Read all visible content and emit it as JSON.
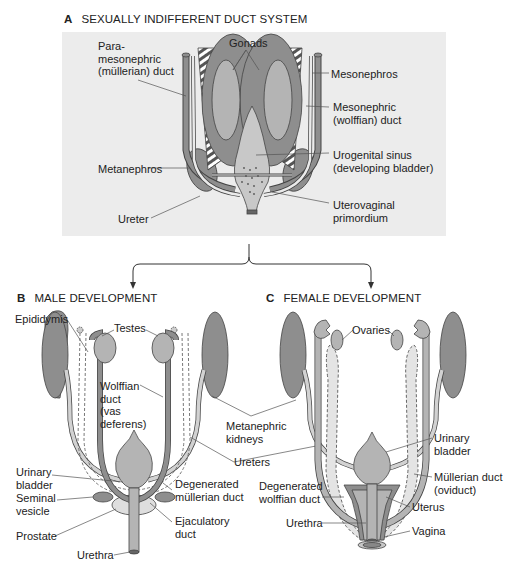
{
  "figure": {
    "colors": {
      "dark_tissue": "#8e8e8e",
      "medium_tissue": "#b4b4b4",
      "light_tissue": "#d2d2d2",
      "panel_bg": "#ececec",
      "line": "#555555"
    },
    "panel_a": {
      "letter": "A",
      "title": "SEXUALLY INDIFFERENT DUCT SYSTEM",
      "labels": {
        "paramesonephric": "Para-\nmesonephric\n(müllerian) duct",
        "gonads": "Gonads",
        "mesonephros": "Mesonephros",
        "mesonephric_duct": "Mesonephric\n(wolffian) duct",
        "metanephros": "Metanephros",
        "urogenital_sinus": "Urogenital sinus\n(developing bladder)",
        "ureter": "Ureter",
        "uterovaginal": "Uterovaginal\nprimordium"
      }
    },
    "panel_b": {
      "letter": "B",
      "title": "MALE DEVELOPMENT",
      "labels": {
        "epididymis": "Epididymis",
        "testes": "Testes",
        "wolffian_duct": "Wolffian\nduct\n(vas\ndeferens)",
        "urinary_bladder": "Urinary\nbladder",
        "degenerated_mullerian": "Degenerated\nmüllerian duct",
        "seminal_vesicle": "Seminal\nvesicle",
        "ejaculatory_duct": "Ejaculatory\nduct",
        "prostate": "Prostate",
        "urethra": "Urethra"
      }
    },
    "shared_labels": {
      "metanephric_kidneys": "Metanephric\nkidneys",
      "ureters": "Ureters"
    },
    "panel_c": {
      "letter": "C",
      "title": "FEMALE DEVELOPMENT",
      "labels": {
        "ovaries": "Ovaries",
        "urinary_bladder": "Urinary\nbladder",
        "mullerian_duct": "Müllerian duct\n(oviduct)",
        "degenerated_wolffian": "Degenerated\nwolffian duct",
        "uterus": "Uterus",
        "urethra": "Urethra",
        "vagina": "Vagina"
      }
    }
  }
}
